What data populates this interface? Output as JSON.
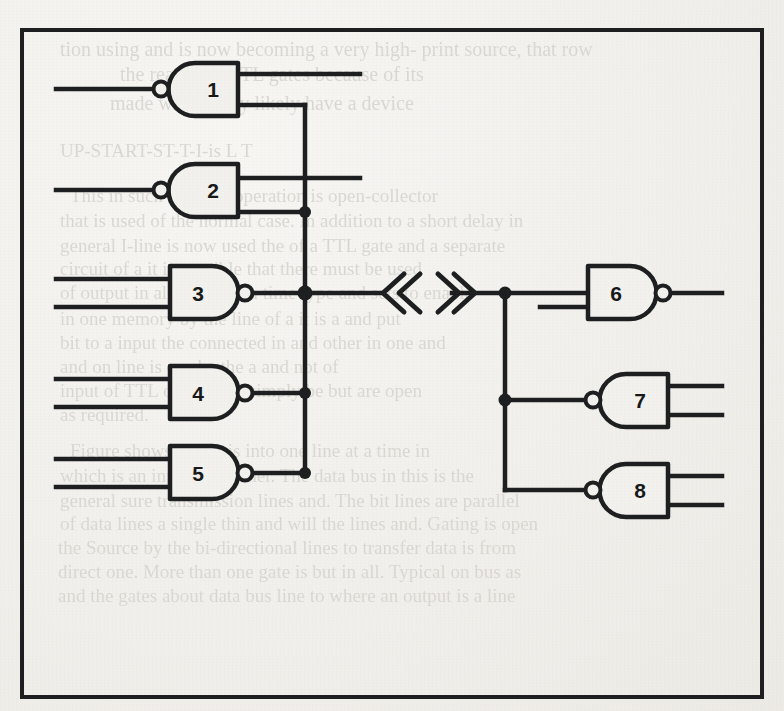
{
  "figure": {
    "kind": "logic-gate-schematic",
    "frame": {
      "x": 22,
      "y": 30,
      "width": 740,
      "height": 667,
      "stroke": "#1d1e20",
      "stroke_width": 4
    },
    "ink_color": "#1d1e20",
    "paper_color": "#f2f1ed",
    "ghost_text_color": "#d9d7d2"
  },
  "gates": [
    {
      "id": "gate-1",
      "label": "1",
      "type": "nand",
      "orientation": "mirrored",
      "body": {
        "x": 168,
        "y": 63,
        "width": 70,
        "height": 53
      },
      "bubble": {
        "cx": 161,
        "cy": 89,
        "r": 7
      },
      "pin_count": 2
    },
    {
      "id": "gate-2",
      "label": "2",
      "type": "nand",
      "orientation": "mirrored",
      "body": {
        "x": 168,
        "y": 164,
        "width": 70,
        "height": 53
      },
      "bubble": {
        "cx": 161,
        "cy": 190,
        "r": 7
      },
      "pin_count": 2
    },
    {
      "id": "gate-3",
      "label": "3",
      "type": "nand",
      "orientation": "normal",
      "body": {
        "x": 170,
        "y": 266,
        "width": 68,
        "height": 53
      },
      "bubble": {
        "cx": 245,
        "cy": 293,
        "r": 7
      },
      "pin_count": 2
    },
    {
      "id": "gate-4",
      "label": "4",
      "type": "nand",
      "orientation": "normal",
      "body": {
        "x": 170,
        "y": 366,
        "width": 68,
        "height": 53
      },
      "bubble": {
        "cx": 245,
        "cy": 393,
        "r": 7
      },
      "pin_count": 2
    },
    {
      "id": "gate-5",
      "label": "5",
      "type": "nand",
      "orientation": "normal",
      "body": {
        "x": 170,
        "y": 446,
        "width": 68,
        "height": 53
      },
      "bubble": {
        "cx": 245,
        "cy": 473,
        "r": 7
      },
      "pin_count": 2
    },
    {
      "id": "gate-6",
      "label": "6",
      "type": "nand",
      "orientation": "normal",
      "body": {
        "x": 588,
        "y": 266,
        "width": 68,
        "height": 53
      },
      "bubble": {
        "cx": 663,
        "cy": 293,
        "r": 7
      },
      "pin_count": 2
    },
    {
      "id": "gate-7",
      "label": "7",
      "type": "nand",
      "orientation": "mirrored",
      "body": {
        "x": 600,
        "y": 374,
        "width": 68,
        "height": 53
      },
      "bubble": {
        "cx": 593,
        "cy": 400,
        "r": 7
      },
      "pin_count": 2
    },
    {
      "id": "gate-8",
      "label": "8",
      "type": "nand",
      "orientation": "mirrored",
      "body": {
        "x": 600,
        "y": 464,
        "width": 68,
        "height": 53
      },
      "bubble": {
        "cx": 593,
        "cy": 490,
        "r": 7
      },
      "pin_count": 2
    }
  ],
  "buses": [
    {
      "id": "left-bus",
      "x": 305,
      "y_top": 110,
      "y_bottom": 473
    },
    {
      "id": "right-bus",
      "x": 505,
      "y_top": 292,
      "y_bottom": 490
    }
  ],
  "junction_dots": [
    {
      "id": "dot-gate2",
      "cx": 305,
      "cy": 212
    },
    {
      "id": "dot-gate3",
      "cx": 305,
      "cy": 293
    },
    {
      "id": "dot-gate4",
      "cx": 305,
      "cy": 393
    },
    {
      "id": "dot-gate5",
      "cx": 305,
      "cy": 473
    },
    {
      "id": "dot-right-top",
      "cx": 505,
      "cy": 292
    },
    {
      "id": "dot-right-mid",
      "cx": 505,
      "cy": 400
    }
  ],
  "break_symbol": {
    "id": "bus-break",
    "glyph_left": "«",
    "glyph_right": "»",
    "left_x": 383,
    "right_x": 440,
    "y": 293,
    "note": "double-chevron break marker on main bus"
  },
  "wires": {
    "input_stub_x_start": 56,
    "output_stub_x_end": 722,
    "gate6_second_input_x_start": 540
  },
  "ghost_text": {
    "note": "faint show-through text from reverse of scanned page",
    "lines": [
      {
        "text": "tion using and is now becoming a very high- print source, that row",
        "x": 60,
        "y": 38,
        "size": 20
      },
      {
        "text": "the reason of  TTL gates because of its",
        "x": 120,
        "y": 63,
        "size": 20
      },
      {
        "text": "made with of any  likely have a device",
        "x": 110,
        "y": 92,
        "size": 20
      },
      {
        "text": "UP-START-ST-T-I-is     L    T",
        "x": 60,
        "y": 140,
        "size": 19
      },
      {
        "text": "This in such TTL the operation is open-collector",
        "x": 70,
        "y": 185,
        "size": 19
      },
      {
        "text": "that is used of the normal case.  In addition to a short delay in",
        "x": 60,
        "y": 210,
        "size": 19
      },
      {
        "text": "general  I-line is now used the  of a TTL gate and a separate",
        "x": 60,
        "y": 235,
        "size": 19
      },
      {
        "text": "circuit    of a      it is possible    that there must be used",
        "x": 60,
        "y": 258,
        "size": 19
      },
      {
        "text": "of output  in all  input from time  type and  sets  to  enable",
        "x": 60,
        "y": 282,
        "size": 19
      },
      {
        "text": "in one  memory  by the line     of a  it   is  a   and  put",
        "x": 60,
        "y": 308,
        "size": 19
      },
      {
        "text": "bit to a  input the connected  in and   other   in   one   and",
        "x": 60,
        "y": 332,
        "size": 19
      },
      {
        "text": "and on  line   is  can  be     the    a    and    not    of",
        "x": 60,
        "y": 356,
        "size": 19
      },
      {
        "text": "input  of TTL  output  in     a     simply   be   but   are  open",
        "x": 60,
        "y": 380,
        "size": 19
      },
      {
        "text": "as  required.",
        "x": 60,
        "y": 404,
        "size": 19
      },
      {
        "text": "Figure  shows  where  is  into  one  line  at  a  time  in",
        "x": 70,
        "y": 440,
        "size": 19
      },
      {
        "text": "which is  an  input  to  another.  The  data  bus  in  this  is  the",
        "x": 60,
        "y": 465,
        "size": 19
      },
      {
        "text": "general  sure   transmission  lines   and.  The  bit  lines  are  parallel",
        "x": 60,
        "y": 490,
        "size": 19
      },
      {
        "text": "of data  lines  a  single  thin  and  will  the  lines  and.  Gating  is  open",
        "x": 60,
        "y": 513,
        "size": 19
      },
      {
        "text": "the  Source   by  the  bi-directional  lines  to  transfer  data  is  from",
        "x": 58,
        "y": 537,
        "size": 19
      },
      {
        "text": "direct  one.  More  than  one  gate  is  but  in  all.   Typical  on  bus  as",
        "x": 58,
        "y": 561,
        "size": 19
      },
      {
        "text": "and the  gates  about  data  bus  line  to  where  an  output  is  a  line",
        "x": 58,
        "y": 585,
        "size": 19
      }
    ]
  }
}
